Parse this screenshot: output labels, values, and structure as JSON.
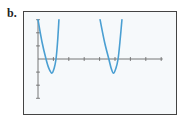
{
  "panel_label": "b.",
  "colors": {
    "curve": "#4a9fd2",
    "axis": "#666666",
    "frame": "#444444",
    "background": "#f6f9fb"
  },
  "chart_data": {
    "type": "line",
    "title": "",
    "xlabel": "",
    "ylabel": "",
    "xlim": [
      0,
      8.1
    ],
    "ylim": [
      -3,
      3
    ],
    "x_ticks": [
      1,
      2,
      3,
      4,
      5,
      6,
      7,
      8
    ],
    "y_ticks": [
      -3,
      -2,
      -1,
      1,
      2,
      3
    ],
    "tick_labels_shown": false,
    "grid": false,
    "legend": "none",
    "series": [
      {
        "name": "branch-1",
        "points": [
          [
            0,
            3
          ],
          [
            0.26,
            1.3
          ],
          [
            0.52,
            0
          ],
          [
            0.7,
            -0.7
          ],
          [
            0.9,
            -1.08
          ],
          [
            1.05,
            -0.7
          ],
          [
            1.17,
            0
          ],
          [
            1.27,
            1.3
          ],
          [
            1.36,
            3
          ]
        ]
      },
      {
        "name": "branch-2",
        "points": [
          [
            4.03,
            3
          ],
          [
            4.32,
            1.3
          ],
          [
            4.6,
            0
          ],
          [
            4.75,
            -0.7
          ],
          [
            4.9,
            -1.08
          ],
          [
            5.06,
            -0.7
          ],
          [
            5.2,
            0
          ],
          [
            5.32,
            1.3
          ],
          [
            5.45,
            3
          ]
        ]
      }
    ]
  }
}
